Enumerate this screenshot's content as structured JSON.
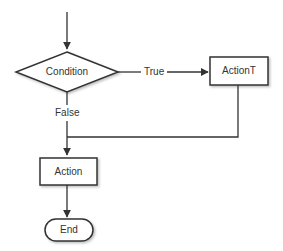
{
  "diagram": {
    "type": "flowchart",
    "nodes": [
      {
        "id": "condition",
        "shape": "diamond",
        "label": "Condition"
      },
      {
        "id": "actionT",
        "shape": "rectangle",
        "label": "ActionT"
      },
      {
        "id": "action",
        "shape": "rectangle",
        "label": "Action"
      },
      {
        "id": "end",
        "shape": "rounded-terminal",
        "label": "End"
      }
    ],
    "edges": [
      {
        "from": "start",
        "to": "condition",
        "label": ""
      },
      {
        "from": "condition",
        "to": "actionT",
        "label": "True"
      },
      {
        "from": "condition",
        "to": "action",
        "label": "False"
      },
      {
        "from": "actionT",
        "to": "action",
        "label": ""
      },
      {
        "from": "action",
        "to": "end",
        "label": ""
      }
    ],
    "colors": {
      "stroke": "#333333",
      "fill": "#ffffff",
      "text": "#333333"
    }
  }
}
